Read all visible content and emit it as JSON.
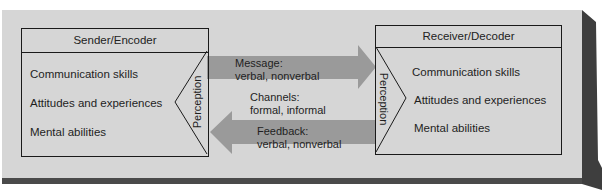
{
  "sender": {
    "title": "Sender/Encoder",
    "items": [
      "Communication skills",
      "Attitudes and experiences",
      "Mental abilities"
    ],
    "perception": "Perception"
  },
  "receiver": {
    "title": "Receiver/Decoder",
    "items": [
      "Communication skills",
      "Attitudes and experiences",
      "Mental abilities"
    ],
    "perception": "Perception"
  },
  "message": {
    "line1": "Message:",
    "line2": "verbal, nonverbal"
  },
  "channels": {
    "line1": "Channels:",
    "line2": "formal, informal"
  },
  "feedback": {
    "line1": "Feedback:",
    "line2": "verbal, nonverbal"
  },
  "colors": {
    "panel": "#d6d6d6",
    "arrow": "#9a9a9a",
    "shadow": "#4a4a4a"
  }
}
